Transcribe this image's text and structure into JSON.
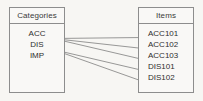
{
  "diagram": {
    "title": "",
    "background_color": "#f7f6f3",
    "line_color": "#6f6f6f",
    "border_color": "#8d8d8d",
    "boxes": [
      {
        "id": "categories",
        "header": "Categories",
        "entries": [
          "ACC",
          "DIS",
          "IMP"
        ]
      },
      {
        "id": "items",
        "header": "Items",
        "entries": [
          "ACC101",
          "ACC102",
          "ACC103",
          "DIS101",
          "DIS102"
        ]
      }
    ],
    "edges": [
      {
        "from": "ACC",
        "to": "ACC101"
      },
      {
        "from": "ACC",
        "to": "ACC102"
      },
      {
        "from": "ACC",
        "to": "ACC103"
      },
      {
        "from": "DIS",
        "to": "DIS101"
      },
      {
        "from": "DIS",
        "to": "DIS102"
      }
    ]
  }
}
